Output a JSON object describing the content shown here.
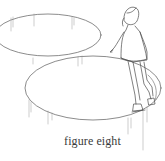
{
  "illustration": {
    "subject": "girl ice skating a figure eight",
    "caption": "figure eight",
    "line_color": "#555555",
    "background": "#ffffff"
  }
}
